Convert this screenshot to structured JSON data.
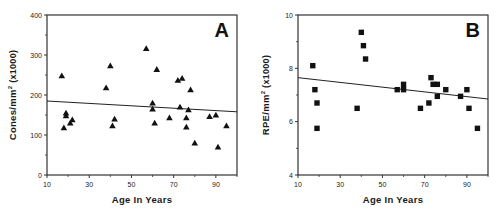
{
  "chart_data": [
    {
      "id": "A",
      "type": "scatter",
      "panel_label": "A",
      "title": "",
      "xlabel": "Age In Years",
      "ylabel": "Cones/mm² (x1000)",
      "ylabel_main": "Cones/mm",
      "ylabel_sup": "2",
      "ylabel_suffix": " (x1000)",
      "xlim": [
        10,
        100
      ],
      "ylim": [
        0,
        400
      ],
      "xticks": [
        10,
        30,
        50,
        70,
        90
      ],
      "xminor": [
        20,
        40,
        60,
        80,
        100
      ],
      "yticks": [
        0,
        100,
        200,
        300,
        400
      ],
      "yminor": [
        50,
        150,
        250,
        350
      ],
      "marker": "triangle",
      "grid": false,
      "legend": null,
      "points": [
        {
          "x": 17,
          "y": 248
        },
        {
          "x": 18,
          "y": 118
        },
        {
          "x": 19,
          "y": 155
        },
        {
          "x": 19,
          "y": 148
        },
        {
          "x": 21,
          "y": 130
        },
        {
          "x": 22,
          "y": 138
        },
        {
          "x": 38,
          "y": 218
        },
        {
          "x": 40,
          "y": 273
        },
        {
          "x": 41,
          "y": 123
        },
        {
          "x": 42,
          "y": 140
        },
        {
          "x": 57,
          "y": 316
        },
        {
          "x": 60,
          "y": 180
        },
        {
          "x": 60,
          "y": 165
        },
        {
          "x": 61,
          "y": 130
        },
        {
          "x": 62,
          "y": 264
        },
        {
          "x": 68,
          "y": 143
        },
        {
          "x": 72,
          "y": 237
        },
        {
          "x": 74,
          "y": 242
        },
        {
          "x": 73,
          "y": 170
        },
        {
          "x": 76,
          "y": 143
        },
        {
          "x": 76,
          "y": 120
        },
        {
          "x": 77,
          "y": 163
        },
        {
          "x": 78,
          "y": 213
        },
        {
          "x": 80,
          "y": 80
        },
        {
          "x": 87,
          "y": 146
        },
        {
          "x": 90,
          "y": 150
        },
        {
          "x": 91,
          "y": 70
        },
        {
          "x": 95,
          "y": 123
        }
      ],
      "regression_line": {
        "x": [
          10,
          100
        ],
        "y": [
          185,
          158
        ]
      }
    },
    {
      "id": "B",
      "type": "scatter",
      "panel_label": "B",
      "title": "",
      "xlabel": "Age In Years",
      "ylabel": "RPE/mm² (x1000)",
      "ylabel_main": "RPE/mm",
      "ylabel_sup": "2",
      "ylabel_suffix": " (x1000)",
      "xlim": [
        10,
        100
      ],
      "ylim": [
        4,
        10
      ],
      "xticks": [
        10,
        30,
        50,
        70,
        90
      ],
      "xminor": [
        20,
        40,
        60,
        80,
        100
      ],
      "yticks": [
        4,
        6,
        8,
        10
      ],
      "yminor": [
        5,
        7,
        9
      ],
      "marker": "square",
      "grid": false,
      "legend": null,
      "points": [
        {
          "x": 17,
          "y": 8.1
        },
        {
          "x": 18,
          "y": 7.2
        },
        {
          "x": 19,
          "y": 6.7
        },
        {
          "x": 19,
          "y": 5.75
        },
        {
          "x": 38,
          "y": 6.5
        },
        {
          "x": 40,
          "y": 9.35
        },
        {
          "x": 41,
          "y": 8.85
        },
        {
          "x": 42,
          "y": 8.35
        },
        {
          "x": 57,
          "y": 7.2
        },
        {
          "x": 60,
          "y": 7.4
        },
        {
          "x": 60,
          "y": 7.2
        },
        {
          "x": 68,
          "y": 6.5
        },
        {
          "x": 72,
          "y": 6.7
        },
        {
          "x": 73,
          "y": 7.65
        },
        {
          "x": 74,
          "y": 7.4
        },
        {
          "x": 76,
          "y": 7.4
        },
        {
          "x": 76,
          "y": 6.95
        },
        {
          "x": 80,
          "y": 7.2
        },
        {
          "x": 87,
          "y": 6.95
        },
        {
          "x": 90,
          "y": 7.2
        },
        {
          "x": 91,
          "y": 6.5
        },
        {
          "x": 95,
          "y": 5.75
        }
      ],
      "regression_line": {
        "x": [
          10,
          100
        ],
        "y": [
          7.65,
          6.85
        ]
      }
    }
  ],
  "colors": {
    "axis": "#333333",
    "marker": "#111111",
    "line": "#222222",
    "background": "#ffffff"
  }
}
